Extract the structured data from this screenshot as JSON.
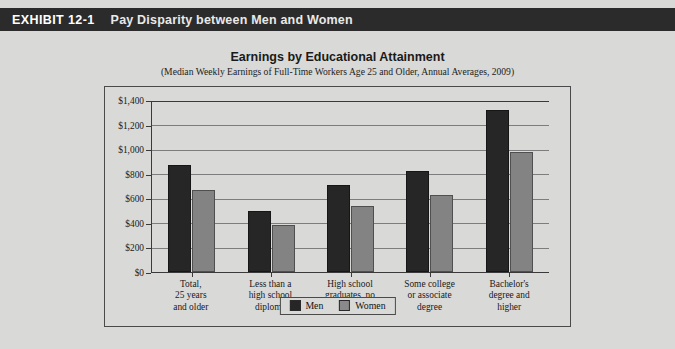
{
  "exhibit": {
    "number": "EXHIBIT 12-1",
    "title": "Pay Disparity between Men and Women"
  },
  "colors": {
    "header_bg": "#2b2b2b",
    "page_bg": "#d9d9d7",
    "men_bar": "#262626",
    "women_bar": "#838383",
    "frame_border": "#4a4a4a",
    "gridline": "#7d7d7d"
  },
  "legend": {
    "items": [
      {
        "label": "Men",
        "color": "#262626"
      },
      {
        "label": "Women",
        "color": "#8a8a8a"
      }
    ]
  },
  "chart_data": {
    "type": "bar",
    "title": "Earnings by Educational Attainment",
    "subtitle": "(Median Weekly Earnings of Full-Time Workers Age 25 and Older, Annual Averages, 2009)",
    "xlabel": "",
    "ylabel": "",
    "ylim": [
      0,
      1400
    ],
    "ytick_step": 200,
    "ytick_labels": [
      "$0",
      "$200",
      "$400",
      "$600",
      "$800",
      "$1,000",
      "$1,200",
      "$1,400"
    ],
    "ytick_values": [
      0,
      200,
      400,
      600,
      800,
      1000,
      1200,
      1400
    ],
    "grid": true,
    "legend_position": "bottom-center",
    "categories": [
      "Total,\n25 years\nand older",
      "Less than a\nhigh school\ndiploma",
      "High school\ngraduates, no\ncollege",
      "Some college\nor associate\ndegree",
      "Bachelor's\ndegree and\nhigher"
    ],
    "series": [
      {
        "name": "Men",
        "color": "#262626",
        "values": [
          873,
          500,
          709,
          831,
          1323
        ]
      },
      {
        "name": "Women",
        "color": "#838383",
        "values": [
          673,
          386,
          543,
          630,
          981
        ]
      }
    ]
  }
}
